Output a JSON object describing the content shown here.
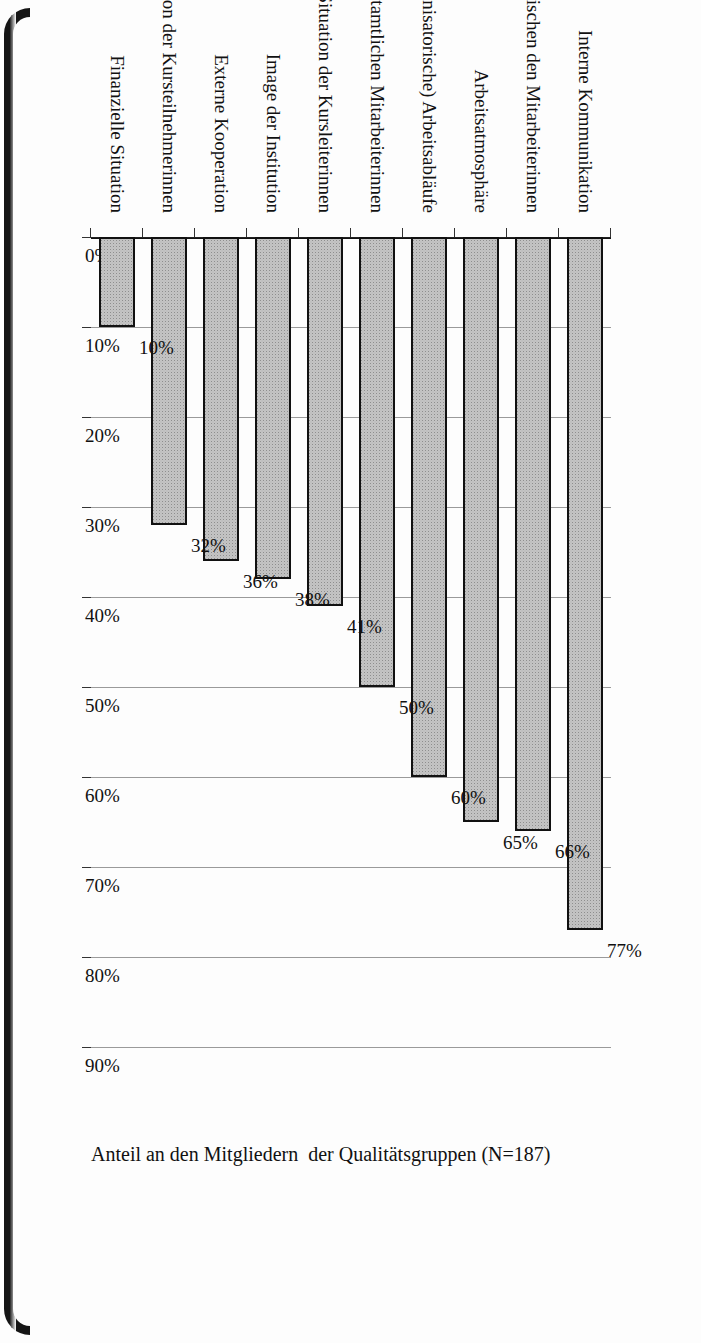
{
  "figure": {
    "value_axis_title": "Anteil an den Mitgliedern  der Qualitätsgruppen (N=187)"
  },
  "chart_data": {
    "type": "bar",
    "orientation": "vertical",
    "title": "",
    "subtitle": "",
    "xlabel": "",
    "ylabel": "Anteil an den Mitgliedern  der Qualitätsgruppen (N=187)",
    "ylim": [
      0,
      90
    ],
    "grid": true,
    "legend": null,
    "legend_position": "none",
    "value_suffix": "%",
    "categories": [
      "Interne Kommunikation",
      "Zusammenarbeit zwischen den Mitarbeiterinnen",
      "Arbeitsatmosphäre",
      "(Organisatorische) Arbeitsabläufe",
      "Situation der hauptamtlichen Mitarbeiterinnen",
      "Situation der Kursleiterinnen",
      "Image der Institution",
      "Externe Kooperation",
      "Situation der Kursteilnehmerinnen",
      "Finanzielle Situation"
    ],
    "values": [
      77,
      66,
      65,
      60,
      50,
      41,
      38,
      36,
      32,
      10
    ],
    "value_labels": [
      "77%",
      "66%",
      "65%",
      "60%",
      "50%",
      "41%",
      "38%",
      "36%",
      "32%",
      "10%"
    ],
    "ticks": [
      0,
      10,
      20,
      30,
      40,
      50,
      60,
      70,
      80,
      90
    ],
    "tick_labels": [
      "0%",
      "10%",
      "20%",
      "30%",
      "40%",
      "50%",
      "60%",
      "70%",
      "80%",
      "90%"
    ]
  },
  "style": {
    "bar_fill": "#c4c4c4",
    "bar_border": "#111111",
    "gridline": "#9a9a9a",
    "axis": "#111111",
    "text": "#111111",
    "page_background": "#fdfdfd",
    "gutter": "#151515"
  }
}
